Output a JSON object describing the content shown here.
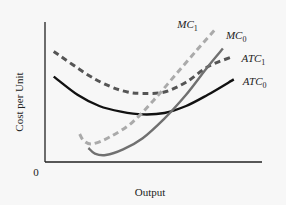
{
  "chart_data": {
    "type": "line",
    "title": "",
    "xlabel": "Output",
    "ylabel": "Cost per Unit",
    "origin_label": "0",
    "x_ticks": [],
    "y_ticks": [],
    "grid": false,
    "legend": "none (curves labeled directly at their right ends)",
    "xlim": [
      0,
      100
    ],
    "ylim": [
      0,
      100
    ],
    "series": [
      {
        "name": "ATC1",
        "label_main": "ATC",
        "label_sub": "1",
        "style": "dashed",
        "color": "#555555",
        "x": [
          4,
          20,
          30,
          38,
          45,
          55,
          65,
          75,
          86
        ],
        "y": [
          79,
          62,
          54,
          50,
          49,
          50,
          57,
          68,
          75
        ]
      },
      {
        "name": "ATC0",
        "label_main": "ATC",
        "label_sub": "0",
        "style": "solid",
        "color": "#111111",
        "x": [
          4,
          15,
          25,
          35,
          45,
          55,
          65,
          75,
          87
        ],
        "y": [
          61,
          48,
          40,
          36,
          34,
          35,
          40,
          48,
          59
        ]
      },
      {
        "name": "MC1",
        "label_main": "MC",
        "label_sub": "1",
        "style": "dashed",
        "color": "#aaaaaa",
        "x": [
          16,
          18,
          22,
          30,
          40,
          50,
          60,
          70,
          78
        ],
        "y": [
          20,
          15,
          13,
          18,
          28,
          44,
          62,
          80,
          94
        ]
      },
      {
        "name": "MC0",
        "label_main": "MC",
        "label_sub": "0",
        "style": "solid",
        "color": "#707070",
        "x": [
          20,
          23,
          28,
          36,
          45,
          55,
          65,
          75,
          82
        ],
        "y": [
          10,
          6,
          5,
          9,
          17,
          31,
          48,
          68,
          81
        ]
      }
    ]
  }
}
